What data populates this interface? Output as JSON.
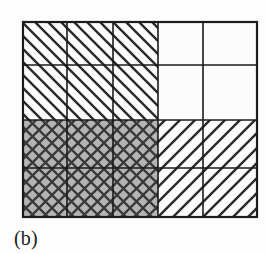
{
  "figure": {
    "caption": "(b)",
    "caption_position": "below-left",
    "background_color": "#fdfdfd",
    "line_color": "#1b1b1b",
    "gray_fill_color": "#b4b4b4",
    "white_fill_color": "#fcfcfc",
    "grid": {
      "x_lines": [
        23,
        67,
        113,
        158,
        203,
        257
      ],
      "y_lines": [
        22,
        65,
        120,
        168,
        217
      ],
      "columns": 5,
      "rows": 4,
      "outer_border_width": 2.2,
      "inner_line_width": 1.6
    },
    "regions": [
      {
        "name": "top-left-region",
        "pattern": "diagonal-backslash-hatch",
        "fill": "#fcfcfc",
        "col_start": 0,
        "col_end": 3,
        "row_start": 0,
        "row_end": 2,
        "hatch_spacing": 13,
        "hatch_width": 2.4,
        "hatch_angle_deg": -45
      },
      {
        "name": "top-right-region",
        "pattern": "blank",
        "fill": "#fcfcfc",
        "col_start": 3,
        "col_end": 5,
        "row_start": 0,
        "row_end": 2,
        "hatch_spacing": 0,
        "hatch_width": 0,
        "hatch_angle_deg": 0
      },
      {
        "name": "bottom-left-region",
        "pattern": "cross-hatch",
        "fill": "#b4b4b4",
        "col_start": 0,
        "col_end": 3,
        "row_start": 2,
        "row_end": 4,
        "hatch_spacing": 13,
        "hatch_width": 2.4,
        "hatch_angle_deg": 45
      },
      {
        "name": "bottom-right-region",
        "pattern": "diagonal-slash-hatch",
        "fill": "#fcfcfc",
        "col_start": 3,
        "col_end": 5,
        "row_start": 2,
        "row_end": 4,
        "hatch_spacing": 15,
        "hatch_width": 2.4,
        "hatch_angle_deg": 45
      }
    ]
  }
}
